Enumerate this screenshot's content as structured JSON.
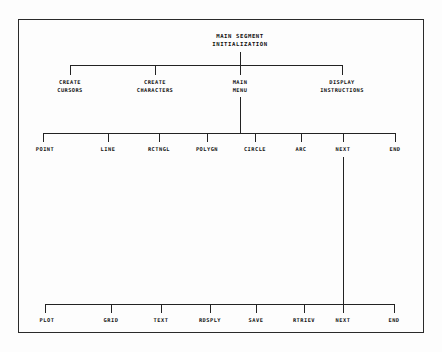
{
  "diagram": {
    "border_color": "#2a2a2a",
    "line_color": "#232323",
    "text_color": "#111111",
    "background": "#fdfdfd",
    "root": {
      "line1": "MAIN SEGMENT",
      "line2": "INITIALIZATION"
    },
    "level2": [
      {
        "line1": "CREATE",
        "line2": "CURSORS"
      },
      {
        "line1": "CREATE",
        "line2": "CHARACTERS"
      },
      {
        "line1": "MAIN",
        "line2": "MENU"
      },
      {
        "line1": "DISPLAY",
        "line2": "INSTRUCTIONS"
      }
    ],
    "level3": [
      {
        "label": "POINT"
      },
      {
        "label": "LINE"
      },
      {
        "label": "RCTNGL"
      },
      {
        "label": "POLYGN"
      },
      {
        "label": "CIRCLE"
      },
      {
        "label": "ARC"
      },
      {
        "label": "NEXT"
      },
      {
        "label": "END"
      }
    ],
    "level4": [
      {
        "label": "PLOT"
      },
      {
        "label": "GRID"
      },
      {
        "label": "TEXT"
      },
      {
        "label": "RDSPLY"
      },
      {
        "label": "SAVE"
      },
      {
        "label": "RTRIEV"
      },
      {
        "label": "NEXT"
      },
      {
        "label": "END"
      }
    ]
  }
}
